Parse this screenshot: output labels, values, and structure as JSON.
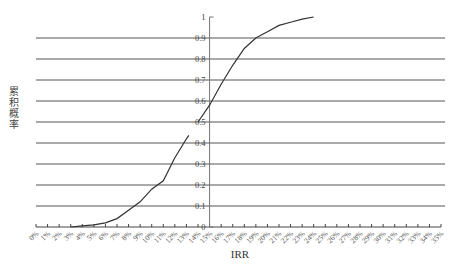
{
  "chart_data": {
    "type": "line",
    "title": "",
    "xlabel": "IRR",
    "ylabel": "累积概率",
    "x_tick_labels": [
      "0%",
      "1%",
      "2%",
      "3%",
      "4%",
      "5%",
      "6%",
      "7%",
      "8%",
      "9%",
      "10%",
      "11%",
      "12%",
      "13%",
      "14%",
      "15%",
      "16%",
      "17%",
      "18%",
      "19%",
      "20%",
      "21%",
      "22%",
      "23%",
      "24%",
      "25%",
      "26%",
      "27%",
      "28%",
      "29%",
      "30%",
      "31%",
      "32%",
      "33%",
      "34%",
      "35%"
    ],
    "y_tick_labels": [
      "0",
      "0.1",
      "0.2",
      "0.3",
      "0.4",
      "0.5",
      "0.6",
      "0.7",
      "0.8",
      "0.9",
      "1"
    ],
    "xlim": [
      0,
      35
    ],
    "ylim": [
      0,
      1
    ],
    "y_axis_position_x": 15,
    "grid": {
      "horizontal": true,
      "vertical": false
    },
    "legend": null,
    "series": [
      {
        "name": "累积概率",
        "color": "#333333",
        "x": [
          3,
          4,
          5,
          6,
          7,
          8,
          9,
          10,
          11,
          12,
          13,
          14,
          15,
          16,
          17,
          18,
          19,
          20,
          21,
          22,
          23,
          24
        ],
        "values": [
          0.0,
          0.005,
          0.01,
          0.02,
          0.04,
          0.08,
          0.12,
          0.18,
          0.22,
          0.33,
          0.42,
          0.5,
          0.58,
          0.68,
          0.77,
          0.85,
          0.9,
          0.93,
          0.96,
          0.975,
          0.99,
          1.0
        ]
      }
    ]
  },
  "labels": {
    "x_title": "IRR",
    "y_title": "累积概率"
  }
}
